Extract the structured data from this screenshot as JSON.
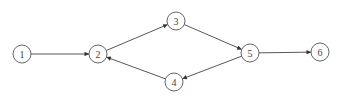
{
  "diagram": {
    "type": "directed-graph",
    "nodes": [
      {
        "id": "1",
        "label": "1",
        "x": 22,
        "y": 54
      },
      {
        "id": "2",
        "label": "2",
        "x": 98,
        "y": 54
      },
      {
        "id": "3",
        "label": "3",
        "x": 176,
        "y": 21
      },
      {
        "id": "4",
        "label": "4",
        "x": 174,
        "y": 82
      },
      {
        "id": "5",
        "label": "5",
        "x": 250,
        "y": 53
      },
      {
        "id": "6",
        "label": "6",
        "x": 320,
        "y": 52
      }
    ],
    "edges": [
      {
        "from": "1",
        "to": "2"
      },
      {
        "from": "2",
        "to": "3"
      },
      {
        "from": "3",
        "to": "5"
      },
      {
        "from": "5",
        "to": "4"
      },
      {
        "from": "4",
        "to": "2"
      },
      {
        "from": "5",
        "to": "6"
      }
    ]
  }
}
